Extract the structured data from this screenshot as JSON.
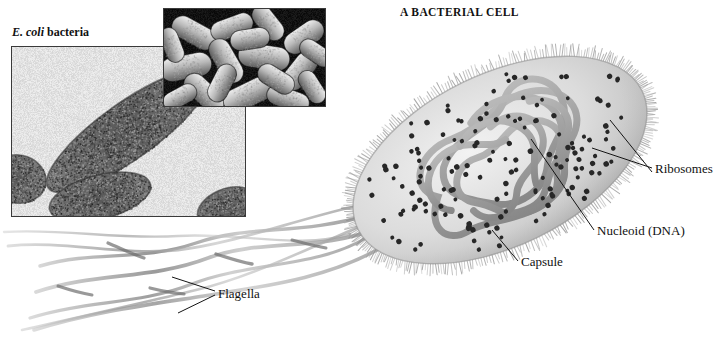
{
  "figure": {
    "title": "A BACTERIAL CELL",
    "background_color": "#ffffff",
    "width": 717,
    "height": 337
  },
  "photo_panel": {
    "caption": "E. coli bacteria",
    "caption_italic_part": "E. coli",
    "caption_roman_part": "bacteria",
    "images": [
      {
        "name": "tem-micrograph",
        "description": "transmission electron micrograph of a sectioned rod-shaped bacterium on pale background",
        "tone": "light background, dark granular cells",
        "rect": [
          11,
          46,
          233,
          169
        ]
      },
      {
        "name": "sem-micrograph",
        "description": "scanning electron micrograph of a cluster of rod-shaped bacteria",
        "tone": "dark background, pale rod cells",
        "rect": [
          163,
          8,
          161,
          97
        ]
      }
    ]
  },
  "diagram": {
    "cell": {
      "name": "bacterial-cell",
      "center": [
        500,
        160
      ],
      "radius_x": 158,
      "radius_y": 86,
      "rotation_deg": -26,
      "body_color": "#d8d8d8",
      "capsule_color": "#9a9a9a"
    },
    "nucleoid_color": "#9e9e9e",
    "ribosome_color": "#2a2a2a",
    "flagella_color": "#b4b4b4",
    "leader_color": "#1a1a1a"
  },
  "callouts": [
    {
      "name": "ribosomes",
      "label": "Ribosomes",
      "x": 655,
      "y": 170
    },
    {
      "name": "nucleoid",
      "label": "Nucleoid (DNA)",
      "x": 597,
      "y": 232
    },
    {
      "name": "capsule",
      "label": "Capsule",
      "x": 521,
      "y": 263
    },
    {
      "name": "flagella",
      "label": "Flagella",
      "x": 218,
      "y": 295
    }
  ]
}
